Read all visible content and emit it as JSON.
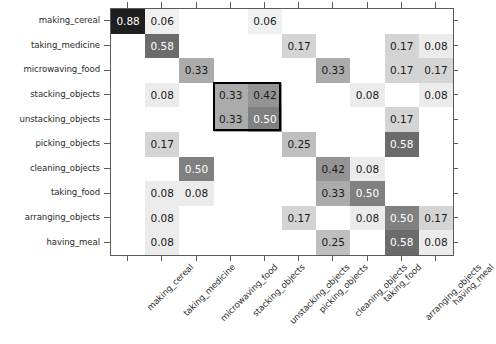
{
  "chart_data": {
    "type": "heatmap",
    "title": "",
    "xlabel": "",
    "ylabel": "",
    "colormap": "gray_reversed",
    "value_range": [
      0,
      1
    ],
    "grid": false,
    "legend": "none",
    "annotations": {
      "highlight_box": {
        "row_start": 3,
        "row_end": 4,
        "col_start": 3,
        "col_end": 4,
        "color": "#000000",
        "description": "black rectangle outlining stacking/unstacking 2x2 block"
      }
    },
    "categories": [
      "making_cereal",
      "taking_medicine",
      "microwaving_food",
      "stacking_objects",
      "unstacking_objects",
      "picking_objects",
      "cleaning_objects",
      "taking_food",
      "arranging_objects",
      "having_meal"
    ],
    "x_tick_labels": [
      "making_cereal",
      "taking_medicine",
      "microwaving_food",
      "stacking_objects",
      "unstacking_objects",
      "picking_objects",
      "cleaning_objects",
      "taking_food",
      "arranging_objects",
      "having_meal"
    ],
    "y_tick_labels": [
      "making_cereal",
      "taking_medicine",
      "microwaving_food",
      "stacking_objects",
      "unstacking_objects",
      "picking_objects",
      "cleaning_objects",
      "taking_food",
      "arranging_objects",
      "having_meal"
    ],
    "values": [
      [
        0.88,
        0.06,
        null,
        null,
        0.06,
        null,
        null,
        null,
        null,
        null
      ],
      [
        null,
        0.58,
        null,
        null,
        null,
        0.17,
        null,
        null,
        0.17,
        0.08
      ],
      [
        null,
        null,
        0.33,
        null,
        null,
        null,
        0.33,
        null,
        0.17,
        0.17
      ],
      [
        null,
        0.08,
        null,
        0.33,
        0.42,
        null,
        null,
        0.08,
        null,
        0.08
      ],
      [
        null,
        null,
        null,
        0.33,
        0.5,
        null,
        null,
        null,
        0.17,
        null
      ],
      [
        null,
        0.17,
        null,
        null,
        null,
        0.25,
        null,
        null,
        0.58,
        null
      ],
      [
        null,
        null,
        0.5,
        null,
        null,
        null,
        0.42,
        0.08,
        null,
        null
      ],
      [
        null,
        0.08,
        0.08,
        null,
        null,
        null,
        0.33,
        0.5,
        null,
        null
      ],
      [
        null,
        0.08,
        null,
        null,
        null,
        0.17,
        null,
        0.08,
        0.5,
        0.17
      ],
      [
        null,
        0.08,
        null,
        null,
        null,
        null,
        0.25,
        null,
        0.58,
        0.08
      ]
    ],
    "cell_text": [
      [
        "0.88",
        "0.06",
        "",
        "",
        "0.06",
        "",
        "",
        "",
        "",
        ""
      ],
      [
        "",
        "0.58",
        "",
        "",
        "",
        "0.17",
        "",
        "",
        "0.17",
        "0.08"
      ],
      [
        "",
        "",
        "0.33",
        "",
        "",
        "",
        "0.33",
        "",
        "0.17",
        "0.17"
      ],
      [
        "",
        "0.08",
        "",
        "0.33",
        "0.42",
        "",
        "",
        "0.08",
        "",
        "0.08"
      ],
      [
        "",
        "",
        "",
        "0.33",
        "0.50",
        "",
        "",
        "",
        "0.17",
        ""
      ],
      [
        "",
        "0.17",
        "",
        "",
        "",
        "0.25",
        "",
        "",
        "0.58",
        ""
      ],
      [
        "",
        "",
        "0.50",
        "",
        "",
        "",
        "0.42",
        "0.08",
        "",
        ""
      ],
      [
        "",
        "0.08",
        "0.08",
        "",
        "",
        "",
        "0.33",
        "0.50",
        "",
        ""
      ],
      [
        "",
        "0.08",
        "",
        "",
        "",
        "0.17",
        "",
        "0.08",
        "0.50",
        "0.17"
      ],
      [
        "",
        "0.08",
        "",
        "",
        "",
        "",
        "0.25",
        "",
        "0.58",
        "0.08"
      ]
    ]
  }
}
